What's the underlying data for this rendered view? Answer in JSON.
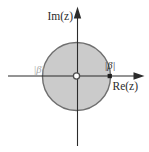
{
  "diagram": {
    "axes": {
      "imaginary_label": "Im(z)",
      "real_label": "Re(z)"
    },
    "radius_labels": {
      "left": "|β|",
      "right": "|β|"
    },
    "shapes": {
      "region": "shaded-disk",
      "origin_marker": "open-circle",
      "boundary_marker": "filled-square"
    },
    "colors": {
      "background": "#ffffff",
      "disk_fill": "#cbcbcb",
      "disk_stroke": "#6f6f6f",
      "axis": "#2b2b2b",
      "text": "#2b2b2b",
      "left_label_faint": "#a6a6a6",
      "boundary_marker": "#1f1f1f"
    }
  }
}
